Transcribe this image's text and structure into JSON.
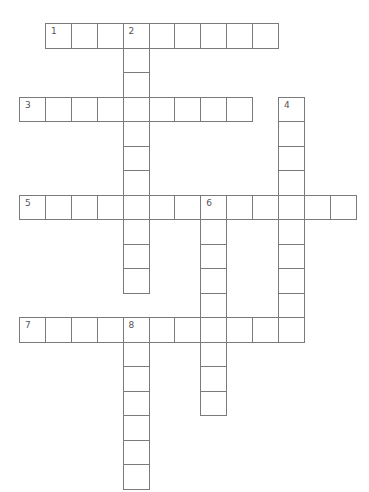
{
  "puzzle": {
    "type": "crossword",
    "cell_size": {
      "w": 25.9,
      "h": 24.5
    },
    "origin": {
      "x": 19,
      "y": 23
    },
    "border_color": "#7a7a7a",
    "number_color": "#555555",
    "entries": [
      {
        "number": "1",
        "direction": "across",
        "row": 0,
        "col": 1,
        "length": 9
      },
      {
        "number": "2",
        "direction": "down",
        "row": 0,
        "col": 4,
        "length": 11
      },
      {
        "number": "3",
        "direction": "across",
        "row": 3,
        "col": 0,
        "length": 9
      },
      {
        "number": "4",
        "direction": "down",
        "row": 3,
        "col": 10,
        "length": 10
      },
      {
        "number": "5",
        "direction": "across",
        "row": 7,
        "col": 0,
        "length": 13
      },
      {
        "number": "6",
        "direction": "down",
        "row": 7,
        "col": 7,
        "length": 9
      },
      {
        "number": "7",
        "direction": "across",
        "row": 12,
        "col": 0,
        "length": 11
      },
      {
        "number": "8",
        "direction": "down",
        "row": 12,
        "col": 4,
        "length": 7
      }
    ]
  }
}
